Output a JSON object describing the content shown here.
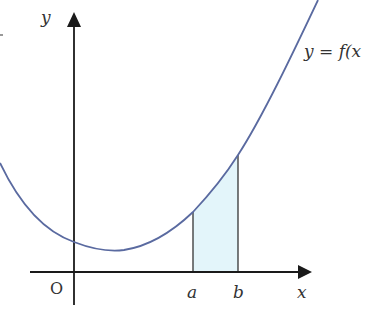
{
  "diagram": {
    "type": "area-under-curve",
    "labels": {
      "y_axis": "y",
      "x_axis": "x",
      "origin": "O",
      "a": "a",
      "b": "b",
      "curve": "y = f(x"
    },
    "colors": {
      "curve": "#5a6aa0",
      "axes": "#1a1a1a",
      "shade": "#e3f5fa",
      "text": "#333333"
    }
  }
}
